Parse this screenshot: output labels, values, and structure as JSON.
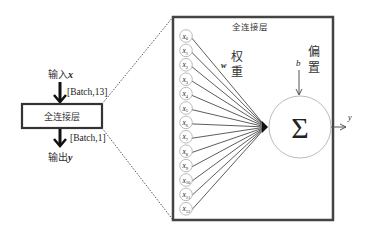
{
  "left": {
    "input_label": "输入",
    "input_var": "x",
    "input_shape": "[Batch,13]",
    "layer_label": "全连接层",
    "output_shape": "[Batch,1]",
    "output_label": "输出",
    "output_var": "y"
  },
  "detail": {
    "title": "全连接层",
    "weight_var": "w",
    "weight_label_1": "权",
    "weight_label_2": "重",
    "bias_var": "b",
    "bias_label_1": "偏",
    "bias_label_2": "置",
    "sum_symbol": "Σ",
    "output_var": "y",
    "inputs": [
      {
        "name": "x",
        "sub": "0"
      },
      {
        "name": "x",
        "sub": "1"
      },
      {
        "name": "x",
        "sub": "2"
      },
      {
        "name": "x",
        "sub": "3"
      },
      {
        "name": "x",
        "sub": "4"
      },
      {
        "name": "x",
        "sub": "5"
      },
      {
        "name": "x",
        "sub": "6"
      },
      {
        "name": "x",
        "sub": "7"
      },
      {
        "name": "x",
        "sub": "8"
      },
      {
        "name": "x",
        "sub": "9"
      },
      {
        "name": "x",
        "sub": "10"
      },
      {
        "name": "x",
        "sub": "11"
      },
      {
        "name": "x",
        "sub": "12"
      }
    ]
  },
  "colors": {
    "frame": "#444444",
    "line": "#333333",
    "node_stroke": "#aaaaaa",
    "circle_stroke": "#bbbbbb"
  }
}
